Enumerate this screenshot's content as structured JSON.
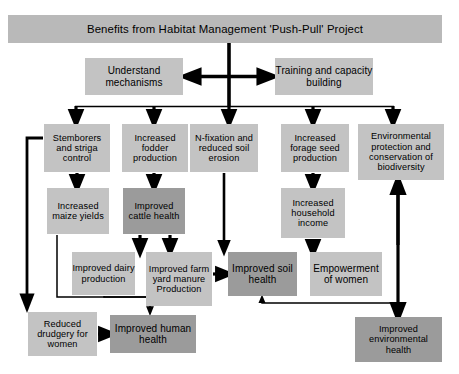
{
  "diagram": {
    "title": "Benefits from Habitat Management 'Push-Pull' Project",
    "type": "flowchart",
    "colors": {
      "light_box": "#c3c3c3",
      "dark_box": "#9b9b9b",
      "header_box": "#b9b9b9",
      "connector": "#000000",
      "background": "#ffffff"
    },
    "nodes": [
      {
        "id": "header",
        "label": "Benefits from Habitat Management 'Push-Pull' Project",
        "tone": "header",
        "x": 8,
        "y": 15,
        "w": 434,
        "h": 28,
        "size": "t11"
      },
      {
        "id": "understand",
        "label": "Understand mechanisms",
        "tone": "light",
        "x": 85,
        "y": 58,
        "w": 98,
        "h": 37,
        "size": "t10"
      },
      {
        "id": "training",
        "label": "Training and capacity building",
        "tone": "light",
        "x": 275,
        "y": 58,
        "w": 98,
        "h": 37,
        "size": "t10"
      },
      {
        "id": "stemborers",
        "label": "Stemborers and striga control",
        "tone": "light",
        "x": 44,
        "y": 124,
        "w": 66,
        "h": 48,
        "size": "t9"
      },
      {
        "id": "fodder",
        "label": "Increased fodder production",
        "tone": "light",
        "x": 122,
        "y": 124,
        "w": 66,
        "h": 48,
        "size": "t9"
      },
      {
        "id": "nfixation",
        "label": "N-fixation and reduced soil erosion",
        "tone": "light",
        "x": 190,
        "y": 124,
        "w": 68,
        "h": 48,
        "size": "t9"
      },
      {
        "id": "forage",
        "label": "Increased forage seed production",
        "tone": "light",
        "x": 281,
        "y": 124,
        "w": 68,
        "h": 48,
        "size": "t9"
      },
      {
        "id": "environment",
        "label": "Environmental protection and conservation of biodiversity",
        "tone": "light",
        "x": 358,
        "y": 124,
        "w": 86,
        "h": 56,
        "size": "t9"
      },
      {
        "id": "maize",
        "label": "Increased maize yields",
        "tone": "light",
        "x": 47,
        "y": 188,
        "w": 62,
        "h": 46,
        "size": "t9"
      },
      {
        "id": "cattle",
        "label": "Improved cattle health",
        "tone": "dark",
        "x": 123,
        "y": 188,
        "w": 62,
        "h": 46,
        "size": "t9"
      },
      {
        "id": "household",
        "label": "Increased household income",
        "tone": "light",
        "x": 281,
        "y": 188,
        "w": 64,
        "h": 50,
        "size": "t9"
      },
      {
        "id": "dairy",
        "label": "Improved dairy production",
        "tone": "light",
        "x": 72,
        "y": 252,
        "w": 63,
        "h": 43,
        "size": "t9"
      },
      {
        "id": "manure",
        "label": "Improved farm yard manure Production",
        "tone": "light",
        "x": 146,
        "y": 252,
        "w": 66,
        "h": 54,
        "size": "t9"
      },
      {
        "id": "soilhealth",
        "label": "Improved soil health",
        "tone": "dark",
        "x": 228,
        "y": 252,
        "w": 69,
        "h": 44,
        "size": "t10"
      },
      {
        "id": "empowerment",
        "label": "Empowerment of women",
        "tone": "light",
        "x": 310,
        "y": 252,
        "w": 72,
        "h": 44,
        "size": "t10"
      },
      {
        "id": "drudgery",
        "label": "Reduced drudgery for women",
        "tone": "light",
        "x": 28,
        "y": 312,
        "w": 69,
        "h": 44,
        "size": "t9"
      },
      {
        "id": "humanhealth",
        "label": "Improved human health",
        "tone": "dark",
        "x": 110,
        "y": 315,
        "w": 86,
        "h": 38,
        "size": "t10"
      },
      {
        "id": "envhealth",
        "label": "Improved environmental health",
        "tone": "dark",
        "x": 355,
        "y": 317,
        "w": 87,
        "h": 45,
        "size": "t9"
      }
    ],
    "edges": [
      {
        "from": "header",
        "to": "distribution-bar"
      },
      {
        "from": "spine",
        "to": "understand"
      },
      {
        "from": "spine",
        "to": "training"
      },
      {
        "from": "bar",
        "to": "stemborers"
      },
      {
        "from": "bar",
        "to": "fodder"
      },
      {
        "from": "bar",
        "to": "nfixation"
      },
      {
        "from": "bar",
        "to": "forage"
      },
      {
        "from": "bar",
        "to": "environment"
      },
      {
        "from": "stemborers",
        "to": "maize"
      },
      {
        "from": "fodder",
        "to": "cattle"
      },
      {
        "from": "forage",
        "to": "household"
      },
      {
        "from": "cattle",
        "to": "dairy"
      },
      {
        "from": "cattle",
        "to": "manure"
      },
      {
        "from": "nfixation",
        "to": "soilhealth"
      },
      {
        "from": "household",
        "to": "empowerment"
      },
      {
        "from": "manure",
        "to": "soilhealth"
      },
      {
        "from": "dairy",
        "to": "humanhealth"
      },
      {
        "from": "maize",
        "to": "humanhealth"
      },
      {
        "from": "drudgery",
        "to": "humanhealth"
      },
      {
        "from": "stemborers",
        "to": "drudgery"
      },
      {
        "from": "environment",
        "to": "envhealth-return"
      },
      {
        "from": "empowerment-rail",
        "to": "envhealth"
      },
      {
        "from": "envhealth-rail",
        "to": "soilhealth"
      }
    ]
  }
}
